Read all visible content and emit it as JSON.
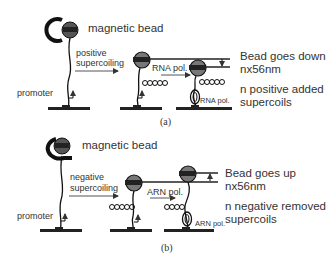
{
  "panels": [
    {
      "id": "a",
      "caption": "(a)",
      "bead_label": "magnetic bead",
      "arrow_label_line1": "positive",
      "arrow_label_line2": "supercoiling",
      "promoter_label": "promoter",
      "polymerase_label_arrow": "RNA pol.",
      "polymerase_label_bound": "RNA pol.",
      "result_line1": "Bead goes down",
      "result_line2": "nx56nm",
      "result_line3": "n positive added",
      "result_line4": "supercoils",
      "bead_direction": "down"
    },
    {
      "id": "b",
      "caption": "(b)",
      "bead_label": "magnetic bead",
      "arrow_label_line1": "negative",
      "arrow_label_line2": "supercoiling",
      "promoter_label": "promoter",
      "polymerase_label_arrow": "ARN pol.",
      "polymerase_label_bound": "ARN pol.",
      "result_line1": "Bead goes up",
      "result_line2": "nx56nm",
      "result_line3": "n negative removed",
      "result_line4": "supercoils",
      "bead_direction": "up"
    }
  ]
}
